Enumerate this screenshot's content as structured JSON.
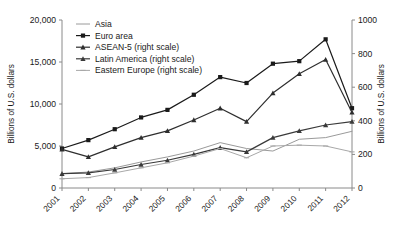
{
  "chart_data": {
    "type": "line",
    "title": "",
    "xlabel": "",
    "ylabel": "Billions of U.S. dollars",
    "ylabel_right": "Billions of U.S. dollars",
    "categories": [
      "2001",
      "2002",
      "2003",
      "2004",
      "2005",
      "2006",
      "2007",
      "2008",
      "2009",
      "2010",
      "2011",
      "2012"
    ],
    "ylim": [
      0,
      20000
    ],
    "ylim_right": [
      0,
      1000
    ],
    "yticks": [
      "0",
      "5,000",
      "10,000",
      "15,000",
      "20,000"
    ],
    "ytick_values": [
      0,
      5000,
      10000,
      15000,
      20000
    ],
    "yticks_right": [
      "0",
      "200",
      "400",
      "600",
      "800",
      "1000"
    ],
    "ytick_values_right": [
      0,
      200,
      400,
      600,
      800,
      1000
    ],
    "grid": false,
    "legend_position": "top-center",
    "series": [
      {
        "name": "Asia",
        "axis": "left",
        "color": "#9a9a9a",
        "marker": "none",
        "values": [
          1700,
          1900,
          2400,
          3100,
          3700,
          4400,
          5400,
          4700,
          4400,
          5800,
          6000,
          6750
        ]
      },
      {
        "name": "Euro area",
        "axis": "left",
        "color": "#1a1a1a",
        "marker": "square",
        "values": [
          4700,
          5700,
          7000,
          8400,
          9300,
          11100,
          13200,
          12500,
          14800,
          15100,
          17700,
          9500
        ]
      },
      {
        "name": "ASEAN-5 (right scale)",
        "axis": "right",
        "color": "#2e2e2e",
        "marker": "triangle",
        "values": [
          230,
          185,
          245,
          300,
          340,
          405,
          475,
          395,
          565,
          680,
          765,
          450
        ]
      },
      {
        "name": "Latin America (right scale)",
        "axis": "right",
        "color": "#3a3a3a",
        "marker": "triangle",
        "values": [
          85,
          90,
          110,
          140,
          165,
          200,
          240,
          215,
          300,
          340,
          375,
          395
        ]
      },
      {
        "name": "Eastern Europe (right scale)",
        "axis": "right",
        "color": "#a8a8a8",
        "marker": "dash",
        "values": [
          55,
          62,
          90,
          120,
          150,
          190,
          235,
          180,
          250,
          255,
          250,
          215
        ]
      }
    ]
  },
  "legend": {
    "items": [
      {
        "label": "Asia"
      },
      {
        "label": "Euro area"
      },
      {
        "label": "ASEAN-5 (right scale)"
      },
      {
        "label": "Latin America (right scale)"
      },
      {
        "label": "Eastern Europe (right scale)"
      }
    ]
  }
}
